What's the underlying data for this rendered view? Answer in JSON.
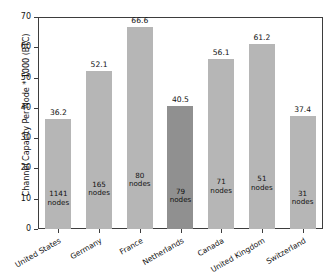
{
  "chart_data": {
    "type": "bar",
    "title": "",
    "xlabel": "",
    "ylabel": "Channel Capacity Per Node * 1000 (BTC)",
    "ylim": [
      0,
      70
    ],
    "yticks": [
      0,
      10,
      20,
      30,
      40,
      50,
      60,
      70
    ],
    "ytick_labels": [
      "0",
      "10",
      "20",
      "30",
      "40",
      "50",
      "60",
      "70"
    ],
    "grid": false,
    "legend": "none",
    "categories": [
      "United States",
      "Germany",
      "France",
      "Netherlands",
      "Canada",
      "United Kingdom",
      "Switzerland"
    ],
    "values": [
      36.2,
      52.1,
      66.6,
      40.5,
      56.1,
      61.2,
      37.4
    ],
    "value_labels": [
      "36.2",
      "52.1",
      "66.6",
      "40.5",
      "56.1",
      "61.2",
      "37.4"
    ],
    "node_counts": [
      1141,
      165,
      80,
      79,
      71,
      51,
      31
    ],
    "node_labels": [
      "1141\nnodes",
      "165\nnodes",
      "80\nnodes",
      "79\nnodes",
      "71\nnodes",
      "51\nnodes",
      "31\nnodes"
    ],
    "bars": [
      {
        "category": "United States",
        "value": 36.2,
        "value_label": "36.2",
        "node_count": 1141,
        "node_line1": "1141",
        "node_line2": "nodes",
        "color": "#b6b6b6",
        "highlight": false
      },
      {
        "category": "Germany",
        "value": 52.1,
        "value_label": "52.1",
        "node_count": 165,
        "node_line1": "165",
        "node_line2": "nodes",
        "color": "#b6b6b6",
        "highlight": false
      },
      {
        "category": "France",
        "value": 66.6,
        "value_label": "66.6",
        "node_count": 80,
        "node_line1": "80",
        "node_line2": "nodes",
        "color": "#b6b6b6",
        "highlight": false
      },
      {
        "category": "Netherlands",
        "value": 40.5,
        "value_label": "40.5",
        "node_count": 79,
        "node_line1": "79",
        "node_line2": "nodes",
        "color": "#909090",
        "highlight": true
      },
      {
        "category": "Canada",
        "value": 56.1,
        "value_label": "56.1",
        "node_count": 71,
        "node_line1": "71",
        "node_line2": "nodes",
        "color": "#b6b6b6",
        "highlight": false
      },
      {
        "category": "United Kingdom",
        "value": 61.2,
        "value_label": "61.2",
        "node_count": 51,
        "node_line1": "51",
        "node_line2": "nodes",
        "color": "#b6b6b6",
        "highlight": false
      },
      {
        "category": "Switzerland",
        "value": 37.4,
        "value_label": "37.4",
        "node_count": 31,
        "node_line1": "31",
        "node_line2": "nodes",
        "color": "#b6b6b6",
        "highlight": false
      }
    ],
    "colors": {
      "bar_default": "#b6b6b6",
      "bar_highlight": "#909090",
      "axis": "#3d3d3d",
      "text": "#141414",
      "background": "#ffffff"
    }
  }
}
